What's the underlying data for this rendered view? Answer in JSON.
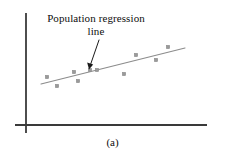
{
  "figure": {
    "caption": "(a)",
    "annotation": {
      "line1": "Population regression",
      "line2": "line"
    },
    "colors": {
      "axis": "#3a3a3a",
      "regression_line": "#8c8c8c",
      "point_fill": "#9a9a9a",
      "point_stroke": "#7d7d7d",
      "arrow": "#1a1a1a",
      "text": "#0d0d0d",
      "background": "#ffffff"
    }
  },
  "chart_data": {
    "type": "scatter",
    "title": "",
    "subtitle": "",
    "xlabel": "",
    "ylabel": "",
    "caption": "(a)",
    "grid": false,
    "legend": null,
    "axes": {
      "x_axis": {
        "x1": 15,
        "y1": 125,
        "x2": 207,
        "y2": 125,
        "arrow": false,
        "ticks": [],
        "tick_labels": []
      },
      "y_axis": {
        "x1": 26,
        "y1": 13,
        "x2": 26,
        "y2": 133,
        "arrow": false,
        "ticks": [],
        "tick_labels": []
      },
      "xlim": [
        15,
        207
      ],
      "ylim": [
        13,
        125
      ]
    },
    "points": [
      {
        "x": 47,
        "y": 77
      },
      {
        "x": 57,
        "y": 86
      },
      {
        "x": 74,
        "y": 72
      },
      {
        "x": 78,
        "y": 81
      },
      {
        "x": 90,
        "y": 70
      },
      {
        "x": 97,
        "y": 70
      },
      {
        "x": 124,
        "y": 74
      },
      {
        "x": 136,
        "y": 55
      },
      {
        "x": 156,
        "y": 60
      },
      {
        "x": 168,
        "y": 47
      }
    ],
    "regression_line": {
      "label": "Population regression line",
      "x1": 41,
      "y1": 84,
      "x2": 185,
      "y2": 48
    },
    "annotations": [
      {
        "text": "Population regression line",
        "text_x": 96,
        "text_y": 26,
        "arrow_from_x": 99,
        "arrow_from_y": 40,
        "arrow_to_x": 89,
        "arrow_to_y": 69
      }
    ]
  }
}
